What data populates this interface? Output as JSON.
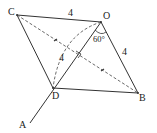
{
  "diagram": {
    "type": "geometry",
    "points": {
      "A": "A",
      "B": "B",
      "C": "C",
      "D": "D",
      "O": "O"
    },
    "labels": {
      "side_CO": "4",
      "side_OB": "4",
      "arc_OD": "4",
      "angle_O": "60°"
    },
    "segments_solid": [
      "CO",
      "OB",
      "BD",
      "DC",
      "AO"
    ],
    "segments_dashed": [
      "CB",
      "arc OD"
    ],
    "marks": [
      "right angle at intersection of CB and DO",
      "equal tick marks on both halves of CB"
    ],
    "colors": {
      "stroke": "#333333",
      "background": "#ffffff"
    }
  }
}
